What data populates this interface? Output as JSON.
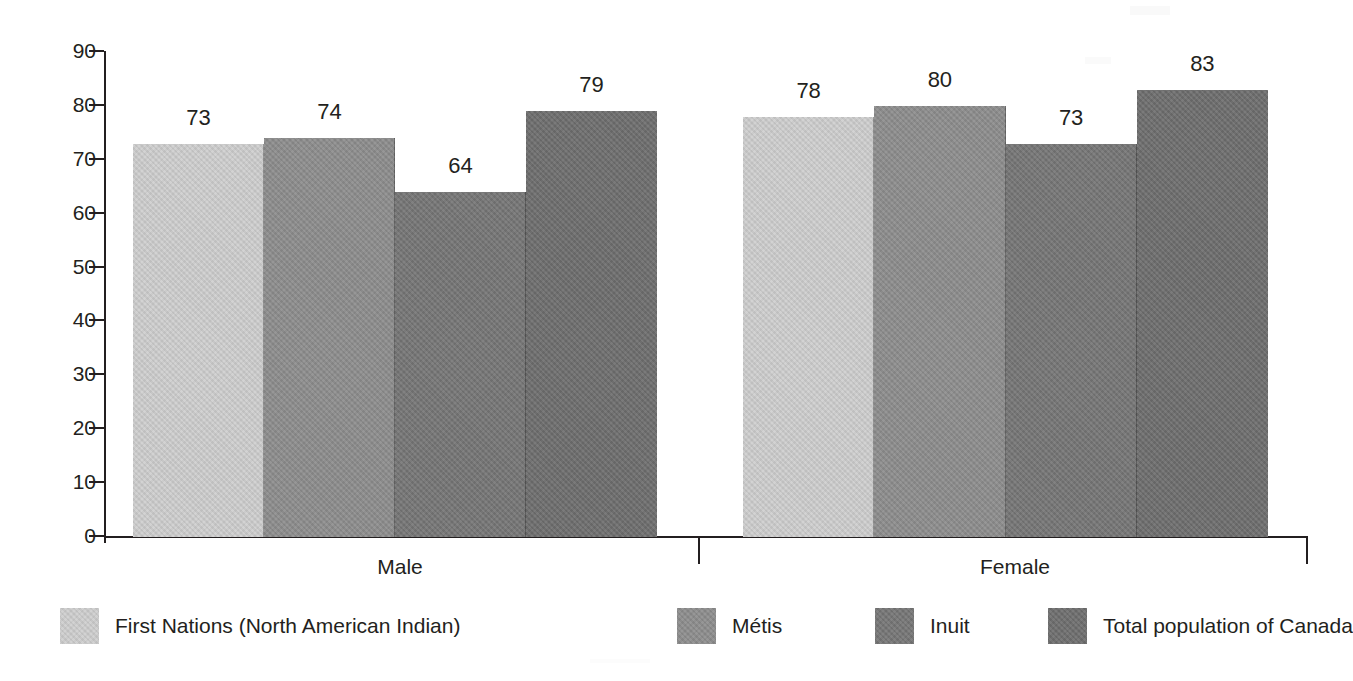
{
  "chart_data": {
    "type": "bar",
    "title": "",
    "subtitle": "",
    "xlabel": "",
    "ylabel": "",
    "categories": [
      "Male",
      "Female"
    ],
    "ylim": [
      0,
      90
    ],
    "yticks": [
      0,
      10,
      20,
      30,
      40,
      50,
      60,
      70,
      80,
      90
    ],
    "ytick_labels": [
      "0",
      "10",
      "20",
      "30",
      "40",
      "50",
      "60",
      "70",
      "80",
      "90"
    ],
    "grid": false,
    "legend_position": "bottom",
    "data_labels": true,
    "series": [
      {
        "name": "First Nations (North American Indian)",
        "color": "#cecece",
        "values": [
          73,
          78
        ]
      },
      {
        "name": "Métis",
        "color": "#8d8d8d",
        "values": [
          74,
          80
        ]
      },
      {
        "name": "Inuit",
        "color": "#767676",
        "values": [
          64,
          73
        ]
      },
      {
        "name": "Total population of Canada",
        "color": "#6e6e6e",
        "values": [
          79,
          83
        ]
      }
    ],
    "value_labels": {
      "Male": [
        "73",
        "74",
        "64",
        "79"
      ],
      "Female": [
        "78",
        "80",
        "73",
        "83"
      ]
    }
  },
  "axis": {
    "y_tick_labels": [
      "90",
      "80",
      "70",
      "60",
      "50",
      "40",
      "30",
      "20",
      "10",
      "0"
    ],
    "category_labels": [
      "Male",
      "Female"
    ]
  },
  "legend": {
    "items": [
      {
        "label": "First Nations (North American Indian)",
        "color": "#cecece"
      },
      {
        "label": "Métis",
        "color": "#8d8d8d"
      },
      {
        "label": "Inuit",
        "color": "#767676"
      },
      {
        "label": "Total population of Canada",
        "color": "#6e6e6e"
      }
    ]
  }
}
